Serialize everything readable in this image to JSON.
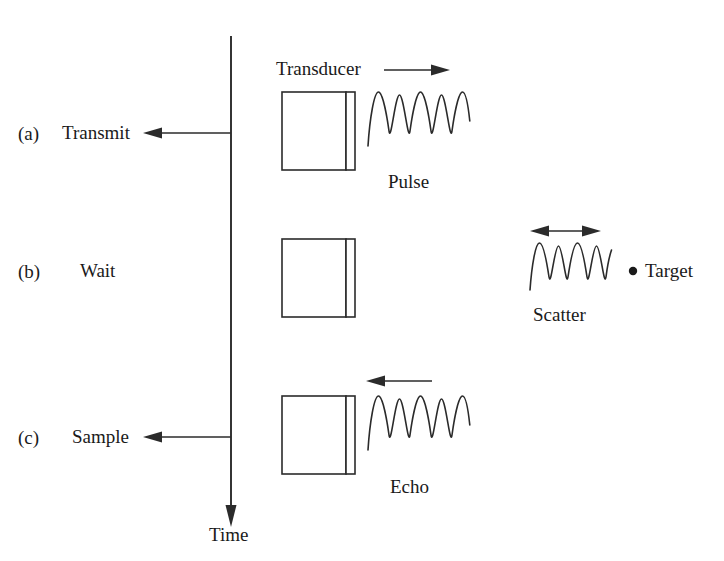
{
  "figure": {
    "background_color": "#ffffff",
    "ink_color": "#2b2b2b"
  },
  "timeline": {
    "axis_label": "Time",
    "direction": "downward",
    "name": "time-axis"
  },
  "rows": [
    {
      "enumerator": "(a)",
      "step_label": "Transmit",
      "has_tick_arrow": true,
      "wave_label": "Pulse",
      "wave_cycles": 4,
      "propagation_arrow": "right"
    },
    {
      "enumerator": "(b)",
      "step_label": "Wait",
      "has_tick_arrow": false,
      "wave_label": "",
      "wave_cycles": 0,
      "propagation_arrow": "none"
    },
    {
      "enumerator": "(c)",
      "step_label": "Sample",
      "has_tick_arrow": true,
      "wave_label": "Echo",
      "wave_cycles": 4,
      "propagation_arrow": "left"
    }
  ],
  "transducer": {
    "label": "Transducer",
    "arrow_direction": "right",
    "face_strip": true
  },
  "scatter": {
    "label": "Scatter",
    "arrow_direction": "both",
    "wave_cycles": 4
  },
  "target": {
    "label": "Target",
    "marker": "dot"
  },
  "icons": {
    "arrow_right": "arrow-right-icon",
    "arrow_left": "arrow-left-icon",
    "arrow_down": "arrow-down-icon",
    "arrow_double": "arrow-double-horizontal-icon",
    "target_dot": "target-dot-icon"
  }
}
